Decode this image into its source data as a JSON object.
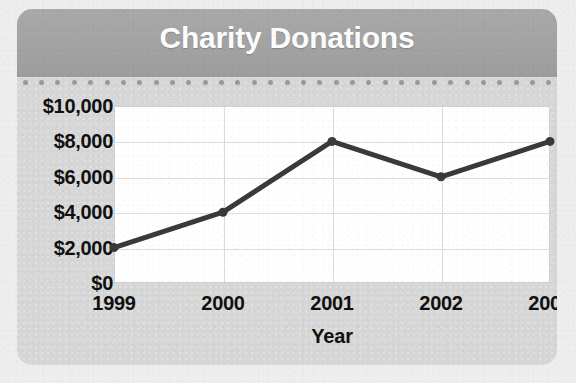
{
  "card": {
    "title": "Charity Donations",
    "background_color": "#d7d7d7",
    "header_color": "#a3a3a3",
    "title_color": "#fdfdfd"
  },
  "separator": {
    "dot_color": "#9a9a9a",
    "dot_count": 33
  },
  "chart_data": {
    "type": "line",
    "title": "Charity Donations",
    "xlabel": "Year",
    "ylabel": "",
    "categories": [
      "1999",
      "2000",
      "2001",
      "2002",
      "2003"
    ],
    "values": [
      2000,
      4000,
      8000,
      6000,
      8000
    ],
    "x": [
      1999,
      2000,
      2001,
      2002,
      2003
    ],
    "ylim": [
      0,
      10000
    ],
    "ytick_values": [
      0,
      2000,
      4000,
      6000,
      8000,
      10000
    ],
    "ytick_labels": [
      "$0",
      "$2,000",
      "$4,000",
      "$6,000",
      "$8,000",
      "$10,000"
    ],
    "xtick_labels": [
      "1999",
      "2000",
      "2001",
      "2002",
      "2003"
    ],
    "grid": true,
    "legend": "none",
    "series": [
      {
        "name": "Donations",
        "values": [
          2000,
          4000,
          8000,
          6000,
          8000
        ],
        "line_color": "#3a3a3a",
        "marker": "circle",
        "marker_color": "#3a3a3a"
      }
    ],
    "plot_background": "#ffffff",
    "gridline_color": "#dcdcdc"
  }
}
